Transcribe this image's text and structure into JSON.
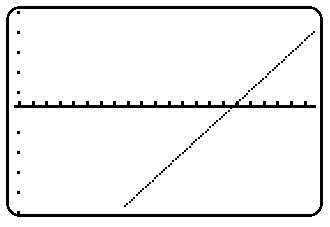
{
  "screen": {
    "device": "graphing-calculator",
    "label": "Graphing Calculator Plot Screen",
    "width": 330,
    "height": 227,
    "background_color": "#ffffff",
    "ink_color": "#000000",
    "bezel": {
      "name": "rounded-screen-frame",
      "x": 6,
      "y": 6,
      "width": 317,
      "height": 211,
      "corner_radius": 13,
      "stroke_width": 2.6
    }
  },
  "chart_data": {
    "type": "line",
    "title": "",
    "subtitle": "",
    "xlabel": "",
    "ylabel": "",
    "grid": false,
    "legend": null,
    "annotations": [],
    "style": "dotted-pixel-plot",
    "axes": {
      "x_axis": {
        "name": "x-axis",
        "visible": true,
        "screen_y": 106,
        "screen_x_start": 14,
        "screen_x_end": 316,
        "thickness": 3,
        "tick_direction": "up",
        "tick_length": 5,
        "tick_spacing_px": 13.6,
        "tick_count": 22,
        "tick_values": [
          -11,
          -10,
          -9,
          -8,
          -7,
          -6,
          -5,
          -4,
          -3,
          -2,
          -1,
          0,
          1,
          2,
          3,
          4,
          5,
          6,
          7,
          8,
          9,
          10
        ],
        "tick_labels": []
      },
      "y_axis": {
        "name": "y-axis",
        "visible": true,
        "screen_x": 18,
        "style": "tick-dots-only",
        "tick_dot_size": 3,
        "tick_spacing_px": 20,
        "tick_count": 10,
        "tick_screen_y": [
          12,
          32,
          52,
          72,
          92,
          132,
          152,
          172,
          192,
          212
        ],
        "tick_values": [
          5,
          4,
          3,
          2,
          1,
          -1,
          -2,
          -3,
          -4,
          -5
        ],
        "tick_labels": []
      }
    },
    "xlim": [
      -11.5,
      10.5
    ],
    "ylim": [
      -5.5,
      5.5
    ],
    "series": [
      {
        "name": "y = x",
        "type": "line",
        "equation": "y1 = x",
        "slope": 1,
        "intercept": 0,
        "point_style": "pixel-dot",
        "point_size": 2.6,
        "point_step_px": 3.1,
        "screen_start": {
          "x": 125,
          "y": 206
        },
        "screen_end": {
          "x": 314,
          "y": 32
        },
        "x_intercept_screen": {
          "x": 233,
          "y": 106
        },
        "x_values": [
          -8,
          -7,
          -6,
          -5,
          -4,
          -3,
          -2,
          -1,
          0,
          1,
          2,
          3,
          4,
          5,
          6
        ],
        "y_values": [
          -8,
          -7,
          -6,
          -5,
          -4,
          -3,
          -2,
          -1,
          0,
          1,
          2,
          3,
          4,
          5,
          6
        ]
      }
    ]
  }
}
